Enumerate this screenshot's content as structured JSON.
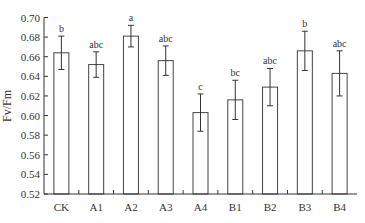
{
  "chart_data": {
    "type": "bar",
    "title": "",
    "xlabel": "",
    "ylabel": "Fv/Fm",
    "ylim": [
      0.52,
      0.7
    ],
    "yticks": [
      "0.52",
      "0.54",
      "0.56",
      "0.58",
      "0.60",
      "0.62",
      "0.64",
      "0.66",
      "0.68",
      "0.70"
    ],
    "grid": false,
    "legend": null,
    "categories": [
      "CK",
      "A1",
      "A2",
      "A3",
      "A4",
      "B1",
      "B2",
      "B3",
      "B4"
    ],
    "values": [
      0.664,
      0.652,
      0.681,
      0.656,
      0.603,
      0.616,
      0.629,
      0.666,
      0.643
    ],
    "error": [
      0.017,
      0.013,
      0.011,
      0.015,
      0.019,
      0.02,
      0.019,
      0.02,
      0.023
    ],
    "significance_labels": [
      "b",
      "abc",
      "a",
      "abc",
      "c",
      "bc",
      "abc",
      "b",
      "abc"
    ]
  },
  "colors": {
    "axis": "#333333",
    "bar_fill": "#ffffff",
    "bar_stroke": "#444444"
  }
}
